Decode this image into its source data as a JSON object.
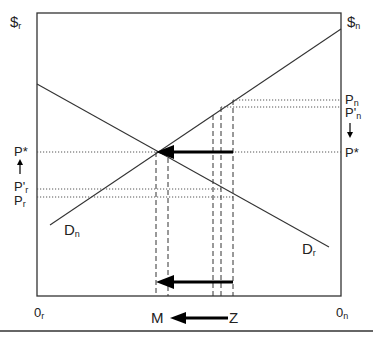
{
  "diagram": {
    "axes": {
      "left_axis_label": "$",
      "left_axis_sub": "r",
      "right_axis_label": "$",
      "right_axis_sub": "n",
      "origin_left": "0",
      "origin_left_sub": "r",
      "origin_right": "0",
      "origin_right_sub": "n"
    },
    "curves": {
      "demand_r": {
        "label": "D",
        "sub": "r"
      },
      "demand_n": {
        "label": "D",
        "sub": "n"
      }
    },
    "left_price_labels": {
      "p_star": "P*",
      "p_prime_r": "P'",
      "p_prime_r_sub": "r",
      "p_r": "P",
      "p_r_sub": "r"
    },
    "right_price_labels": {
      "p_n": "P",
      "p_n_sub": "n",
      "p_prime_n": "P'",
      "p_prime_n_sub": "n",
      "p_star": "P*"
    },
    "quantity_labels": {
      "m": "M",
      "z": "Z"
    },
    "colors": {
      "line": "#333333",
      "arrow": "#000000",
      "background": "#ffffff"
    }
  }
}
